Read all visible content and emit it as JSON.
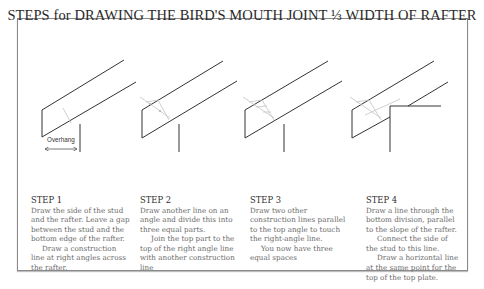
{
  "title": "STEPS for DRAWING THE BIRD'S MOUTH JOINT ⅓ WIDTH OF RAFTER",
  "overhang_label": "Overhang",
  "steps": [
    {
      "heading": "STEP 1",
      "para1": "Draw the side of the stud and the rafter. Leave a gap between the stud and the bottom edge of the rafter.",
      "para2": "Draw a construction line at right angles across the rafter."
    },
    {
      "heading": "STEP 2",
      "para1": "Draw another line on an angle and divide this into three equal parts.",
      "para2": "Join the top part to the top of the right angle line with another construction line"
    },
    {
      "heading": "STEP 3",
      "para1": "Draw two other construction lines parallel to the top angle to touch the right-angle line.",
      "para2": "You now have three equal spaces"
    },
    {
      "heading": "STEP 4",
      "para1": "Draw a line through the bottom division, parallel to the slope of the rafter.",
      "para2": "Connect the side of the stud to this line.",
      "para3": "Draw a horizontal line at the same point for the top of the top plate."
    }
  ],
  "colors": {
    "line": "#333333",
    "construction": "#c4c4c4",
    "text": "#6a6a6a",
    "heading": "#2e2e2e",
    "frame": "#8a8a8a"
  }
}
